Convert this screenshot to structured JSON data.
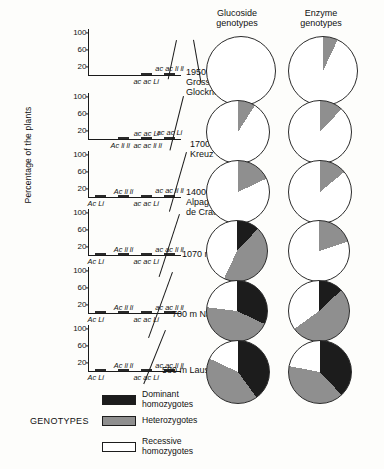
{
  "axis_title": "Percentage of the plants",
  "y_ticks": [
    100,
    60,
    20
  ],
  "legend": {
    "heading": "GENOTYPES",
    "items": [
      {
        "label": "Dominant\nhomozygotes",
        "color": "#1c1c1c",
        "key": "dominant"
      },
      {
        "label": "Heterozygotes",
        "color": "#8f8f8f",
        "key": "heterozygote"
      },
      {
        "label": "Recessive\nhomozygotes",
        "color": "#ffffff",
        "key": "recessive"
      }
    ]
  },
  "pie_columns": [
    {
      "title": "Glucoside\ngenotypes"
    },
    {
      "title": "Enzyme\ngenotypes"
    }
  ],
  "sites": [
    {
      "altitude": "1950 m",
      "name": "Gross\nGlockner",
      "label": "1950 m\nGross\nGlockner",
      "chart_index": 0
    },
    {
      "altitude": "1700 m",
      "name": "Kreuz",
      "label": "1700 m\nKreuz",
      "chart_index": 1
    },
    {
      "altitude": "1400 m",
      "name": "Alpage\nde Crausey",
      "label": "1400 m\nAlpage\nde Crausey",
      "chart_index": 2
    },
    {
      "altitude": "1070 m",
      "name": "Fiesch",
      "label": "1070 m  Fiesch",
      "chart_index": 3
    },
    {
      "altitude": "700 m",
      "name": "Naters",
      "label": "700 m  Naters",
      "chart_index": 4
    },
    {
      "altitude": "580 m",
      "name": "Lausanne",
      "label": "580 m  Lausanne",
      "chart_index": 5
    }
  ],
  "chart_data": [
    {
      "type": "bar",
      "title": "1950 m Gross Glockner",
      "categories": [
        "Ac Li",
        "Ac li li",
        "ac ac Li",
        "ac ac li li"
      ],
      "values": [
        0,
        0,
        12,
        95
      ],
      "ylabel": "Percentage of the plants",
      "ylim": [
        0,
        110
      ],
      "yticks": [
        20,
        60,
        100
      ],
      "grid": false,
      "bar_labels_below": [
        "",
        "",
        "ac ac Li",
        ""
      ],
      "bar_labels_above": [
        "",
        "",
        "",
        "ac ac li li"
      ]
    },
    {
      "type": "bar",
      "title": "1700 m Kreuz",
      "categories": [
        "Ac Li",
        "Ac li li",
        "ac ac Li",
        "ac ac li li"
      ],
      "values": [
        0,
        8,
        7,
        88
      ],
      "ylabel": "Percentage of the plants",
      "ylim": [
        0,
        110
      ],
      "yticks": [
        20,
        60,
        100
      ],
      "grid": false,
      "bar_labels_below": [
        "",
        "Ac li li",
        "ac ac li li",
        ""
      ],
      "bar_labels_above": [
        "",
        "",
        "ac ac Li",
        "ac ac Li"
      ]
    },
    {
      "type": "bar",
      "title": "1400 m Alpage de Crausey",
      "categories": [
        "Ac Li",
        "Ac li li",
        "ac ac Li",
        "ac ac li li"
      ],
      "values": [
        10,
        17,
        8,
        85
      ],
      "ylabel": "Percentage of the plants",
      "ylim": [
        0,
        110
      ],
      "yticks": [
        20,
        60,
        100
      ],
      "grid": false,
      "bar_labels_below": [
        "Ac Li",
        "",
        "ac ac Li",
        ""
      ],
      "bar_labels_above": [
        "",
        "Ac li li",
        "",
        "ac ac li li"
      ]
    },
    {
      "type": "bar",
      "title": "1070 m Fiesch",
      "categories": [
        "Ac Li",
        "Ac li li",
        "ac ac Li",
        "ac ac li li"
      ],
      "values": [
        15,
        55,
        12,
        57
      ],
      "ylabel": "Percentage of the plants",
      "ylim": [
        0,
        110
      ],
      "yticks": [
        20,
        60,
        100
      ],
      "grid": false,
      "bar_labels_below": [
        "Ac Li",
        "",
        "ac ac Li",
        ""
      ],
      "bar_labels_above": [
        "",
        "Ac li li",
        "",
        "ac ac li li"
      ]
    },
    {
      "type": "bar",
      "title": "700 m Naters",
      "categories": [
        "Ac Li",
        "Ac li li",
        "ac ac Li",
        "ac ac li li"
      ],
      "values": [
        22,
        55,
        8,
        18
      ],
      "ylabel": "Percentage of the plants",
      "ylim": [
        0,
        110
      ],
      "yticks": [
        20,
        60,
        100
      ],
      "grid": false,
      "bar_labels_below": [
        "Ac Li",
        "",
        "ac ac Li",
        ""
      ],
      "bar_labels_above": [
        "",
        "Ac li li",
        "",
        "ac ac li li"
      ]
    },
    {
      "type": "bar",
      "title": "580 m Lausanne",
      "categories": [
        "Ac Li",
        "Ac li li",
        "ac ac Li",
        "ac ac li li"
      ],
      "values": [
        70,
        18,
        8,
        8
      ],
      "ylabel": "Percentage of the plants",
      "ylim": [
        0,
        110
      ],
      "yticks": [
        20,
        60,
        100
      ],
      "grid": false,
      "bar_labels_below": [
        "Ac Li",
        "",
        "ac ac Li",
        ""
      ],
      "bar_labels_above": [
        "",
        "Ac li li",
        "",
        "ac ac li li"
      ]
    },
    {
      "type": "pie",
      "title": "Glucoside genotypes 1950 m",
      "labels": [
        "Dominant homozygotes",
        "Heterozygotes",
        "Recessive homozygotes"
      ],
      "values": [
        0,
        0,
        100
      ],
      "colors": [
        "#1c1c1c",
        "#8f8f8f",
        "#ffffff"
      ]
    },
    {
      "type": "pie",
      "title": "Enzyme genotypes 1950 m",
      "labels": [
        "Dominant homozygotes",
        "Heterozygotes",
        "Recessive homozygotes"
      ],
      "values": [
        0,
        7,
        93
      ],
      "colors": [
        "#1c1c1c",
        "#8f8f8f",
        "#ffffff"
      ]
    },
    {
      "type": "pie",
      "title": "Glucoside genotypes 1700 m",
      "labels": [
        "Dominant homozygotes",
        "Heterozygotes",
        "Recessive homozygotes"
      ],
      "values": [
        0,
        9,
        91
      ],
      "colors": [
        "#1c1c1c",
        "#8f8f8f",
        "#ffffff"
      ]
    },
    {
      "type": "pie",
      "title": "Enzyme genotypes 1700 m",
      "labels": [
        "Dominant homozygotes",
        "Heterozygotes",
        "Recessive homozygotes"
      ],
      "values": [
        0,
        12,
        88
      ],
      "colors": [
        "#1c1c1c",
        "#8f8f8f",
        "#ffffff"
      ]
    },
    {
      "type": "pie",
      "title": "Glucoside genotypes 1400 m",
      "labels": [
        "Dominant homozygotes",
        "Heterozygotes",
        "Recessive homozygotes"
      ],
      "values": [
        0,
        18,
        82
      ],
      "colors": [
        "#1c1c1c",
        "#8f8f8f",
        "#ffffff"
      ]
    },
    {
      "type": "pie",
      "title": "Enzyme genotypes 1400 m",
      "labels": [
        "Dominant homozygotes",
        "Heterozygotes",
        "Recessive homozygotes"
      ],
      "values": [
        0,
        14,
        86
      ],
      "colors": [
        "#1c1c1c",
        "#8f8f8f",
        "#ffffff"
      ]
    },
    {
      "type": "pie",
      "title": "Glucoside genotypes 1070 m",
      "labels": [
        "Dominant homozygotes",
        "Heterozygotes",
        "Recessive homozygotes"
      ],
      "values": [
        12,
        45,
        43
      ],
      "colors": [
        "#1c1c1c",
        "#8f8f8f",
        "#ffffff"
      ]
    },
    {
      "type": "pie",
      "title": "Enzyme genotypes 1070 m",
      "labels": [
        "Dominant homozygotes",
        "Heterozygotes",
        "Recessive homozygotes"
      ],
      "values": [
        0,
        20,
        80
      ],
      "colors": [
        "#1c1c1c",
        "#8f8f8f",
        "#ffffff"
      ]
    },
    {
      "type": "pie",
      "title": "Glucoside genotypes 700 m",
      "labels": [
        "Dominant homozygotes",
        "Heterozygotes",
        "Recessive homozygotes"
      ],
      "values": [
        32,
        45,
        23
      ],
      "colors": [
        "#1c1c1c",
        "#8f8f8f",
        "#ffffff"
      ]
    },
    {
      "type": "pie",
      "title": "Enzyme genotypes 700 m",
      "labels": [
        "Dominant homozygotes",
        "Heterozygotes",
        "Recessive homozygotes"
      ],
      "values": [
        13,
        52,
        35
      ],
      "colors": [
        "#1c1c1c",
        "#8f8f8f",
        "#ffffff"
      ]
    },
    {
      "type": "pie",
      "title": "Glucoside genotypes 580 m",
      "labels": [
        "Dominant homozygotes",
        "Heterozygotes",
        "Recessive homozygotes"
      ],
      "values": [
        40,
        42,
        18
      ],
      "colors": [
        "#1c1c1c",
        "#8f8f8f",
        "#ffffff"
      ]
    },
    {
      "type": "pie",
      "title": "Enzyme genotypes 580 m",
      "labels": [
        "Dominant homozygotes",
        "Heterozygotes",
        "Recessive homozygotes"
      ],
      "values": [
        38,
        40,
        22
      ],
      "colors": [
        "#1c1c1c",
        "#8f8f8f",
        "#ffffff"
      ]
    }
  ]
}
